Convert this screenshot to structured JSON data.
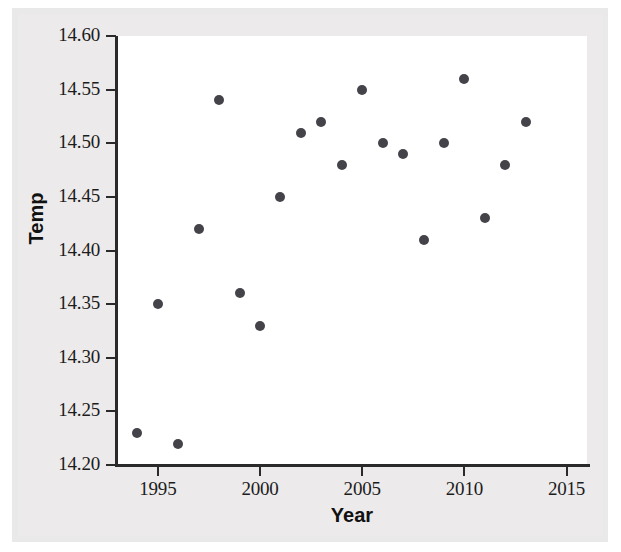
{
  "chart_data": {
    "type": "scatter",
    "title": "",
    "xlabel": "Year",
    "ylabel": "Temp",
    "xlim": [
      1993,
      2016
    ],
    "ylim": [
      14.2,
      14.6
    ],
    "grid": false,
    "legend": null,
    "x_ticks": [
      1995,
      2000,
      2005,
      2010,
      2015
    ],
    "x_tick_labels": [
      "1995",
      "2000",
      "2005",
      "2010",
      "2015"
    ],
    "y_ticks": [
      14.2,
      14.25,
      14.3,
      14.35,
      14.4,
      14.45,
      14.5,
      14.55,
      14.6
    ],
    "y_tick_labels": [
      "14.20",
      "14.25",
      "14.30",
      "14.35",
      "14.40",
      "14.45",
      "14.50",
      "14.55",
      "14.60"
    ],
    "marker_color": "#434349",
    "x": [
      1994,
      1995,
      1996,
      1997,
      1998,
      1999,
      2000,
      2001,
      2002,
      2003,
      2004,
      2005,
      2006,
      2007,
      2008,
      2009,
      2010,
      2011,
      2012,
      2013
    ],
    "y": [
      14.23,
      14.35,
      14.22,
      14.42,
      14.54,
      14.36,
      14.33,
      14.45,
      14.51,
      14.52,
      14.48,
      14.55,
      14.5,
      14.49,
      14.41,
      14.5,
      14.56,
      14.43,
      14.48,
      14.52
    ],
    "points": [
      {
        "year": 1994,
        "temp": 14.23
      },
      {
        "year": 1995,
        "temp": 14.35
      },
      {
        "year": 1996,
        "temp": 14.22
      },
      {
        "year": 1997,
        "temp": 14.42
      },
      {
        "year": 1998,
        "temp": 14.54
      },
      {
        "year": 1999,
        "temp": 14.36
      },
      {
        "year": 2000,
        "temp": 14.33
      },
      {
        "year": 2001,
        "temp": 14.45
      },
      {
        "year": 2002,
        "temp": 14.51
      },
      {
        "year": 2003,
        "temp": 14.52
      },
      {
        "year": 2004,
        "temp": 14.48
      },
      {
        "year": 2005,
        "temp": 14.55
      },
      {
        "year": 2006,
        "temp": 14.5
      },
      {
        "year": 2007,
        "temp": 14.49
      },
      {
        "year": 2008,
        "temp": 14.41
      },
      {
        "year": 2009,
        "temp": 14.5
      },
      {
        "year": 2010,
        "temp": 14.56
      },
      {
        "year": 2011,
        "temp": 14.43
      },
      {
        "year": 2012,
        "temp": 14.48
      },
      {
        "year": 2013,
        "temp": 14.52
      }
    ]
  }
}
